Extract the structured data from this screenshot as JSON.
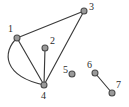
{
  "figure": {
    "name": "undirected-graph-diagram",
    "background_color": "#ffffff",
    "width": 129,
    "height": 107
  },
  "style": {
    "node_fill": "#9a9a9a",
    "node_stroke": "#4a4a4a",
    "node_radius": 3,
    "edge_color": "#3b3b3b",
    "edge_width": 1.15,
    "label_color": "#2b2b2b"
  },
  "chart_data": {
    "type": "diagram",
    "subtype": "node-link-graph",
    "title": "",
    "directed": false,
    "node_count": 7,
    "edge_count": 6,
    "components": [
      {
        "nodes": [
          "1",
          "2",
          "3",
          "4"
        ]
      },
      {
        "nodes": [
          "5"
        ]
      },
      {
        "nodes": [
          "6",
          "7"
        ]
      }
    ],
    "nodes": [
      {
        "id": "1",
        "label": "1",
        "x": 17,
        "y": 38,
        "label_x": 8,
        "label_y": 24,
        "degree": 3
      },
      {
        "id": "2",
        "label": "2",
        "x": 45,
        "y": 48,
        "label_x": 50,
        "label_y": 36,
        "degree": 1
      },
      {
        "id": "3",
        "label": "3",
        "x": 84,
        "y": 11,
        "label_x": 89,
        "label_y": 2,
        "degree": 2
      },
      {
        "id": "4",
        "label": "4",
        "x": 44,
        "y": 85,
        "label_x": 41,
        "label_y": 91,
        "degree": 4
      },
      {
        "id": "5",
        "label": "5",
        "x": 72,
        "y": 74,
        "label_x": 63,
        "label_y": 65,
        "degree": 0
      },
      {
        "id": "6",
        "label": "6",
        "x": 95,
        "y": 73,
        "label_x": 87,
        "label_y": 60,
        "degree": 1
      },
      {
        "id": "7",
        "label": "7",
        "x": 112,
        "y": 93,
        "label_x": 116,
        "label_y": 80,
        "degree": 1
      }
    ],
    "edges": [
      {
        "id": "e1",
        "source": "1",
        "target": "3",
        "shape": "straight",
        "path": "M 17 38 L 84 11"
      },
      {
        "id": "e2",
        "source": "3",
        "target": "4",
        "shape": "straight",
        "path": "M 84 11 L 44 85"
      },
      {
        "id": "e3",
        "source": "1",
        "target": "4",
        "shape": "straight",
        "path": "M 17 38 L 44 85"
      },
      {
        "id": "e4",
        "source": "1",
        "target": "4",
        "shape": "curved",
        "path": "M 17 38 C 2 52, 3 76, 44 85"
      },
      {
        "id": "e5",
        "source": "2",
        "target": "4",
        "shape": "straight",
        "path": "M 45 48 L 44 85"
      },
      {
        "id": "e6",
        "source": "6",
        "target": "7",
        "shape": "straight",
        "path": "M 95 73 L 112 93"
      }
    ]
  }
}
